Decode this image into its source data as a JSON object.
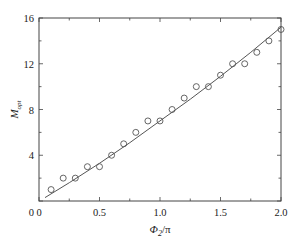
{
  "chart_data": {
    "type": "scatter",
    "title": "",
    "xlabel": "Φ2/π",
    "ylabel": "M_opt",
    "xlabel_parts": {
      "main": "Φ",
      "sub": "2",
      "rest": "/π"
    },
    "ylabel_parts": {
      "main": "M",
      "sub": "opt"
    },
    "xlim": [
      0,
      2.0
    ],
    "ylim": [
      0,
      16
    ],
    "xticks": [
      "0",
      "0.5",
      "1.0",
      "1.5",
      "2.0"
    ],
    "yticks": [
      "4",
      "8",
      "12",
      "16"
    ],
    "y_origin_label": "0",
    "grid": false,
    "legend": null,
    "series": [
      {
        "name": "data",
        "style": "open-circle",
        "x": [
          0.1,
          0.2,
          0.3,
          0.4,
          0.5,
          0.6,
          0.7,
          0.8,
          0.9,
          1.0,
          1.1,
          1.2,
          1.3,
          1.4,
          1.5,
          1.6,
          1.7,
          1.8,
          1.9,
          2.0
        ],
        "y": [
          1,
          2,
          2,
          3,
          3,
          4,
          5,
          6,
          7,
          7,
          8,
          9,
          10,
          10,
          11,
          12,
          12,
          13,
          14,
          15
        ]
      },
      {
        "name": "fit",
        "style": "line",
        "x": [
          0.05,
          0.25,
          0.5,
          0.75,
          1.0,
          1.25,
          1.5,
          1.75,
          2.0
        ],
        "y": [
          0.3,
          1.6,
          3.3,
          5.1,
          7.0,
          8.9,
          10.9,
          13.0,
          15.2
        ]
      }
    ]
  }
}
